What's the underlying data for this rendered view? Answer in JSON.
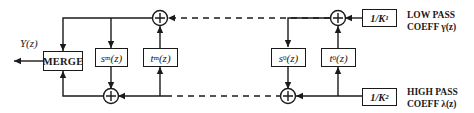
{
  "diagram": {
    "output_label": "Y(z)",
    "merge_label": "MERGE",
    "blocks": {
      "s_m": {
        "base": "s",
        "sub": "m",
        "arg": "(z)"
      },
      "t_m": {
        "base": "t",
        "sub": "m",
        "arg": "(z)"
      },
      "s_0": {
        "base": "s",
        "sub": "0",
        "arg": "(z)"
      },
      "t_0": {
        "base": "t",
        "sub": "0",
        "arg": "(z)"
      },
      "k1": {
        "base": "1/K",
        "sub": "1"
      },
      "k2": {
        "base": "1/K",
        "sub": "2"
      }
    },
    "low_pass": {
      "line1": "LOW PASS",
      "line2": "COEFF γ(z)"
    },
    "high_pass": {
      "line1": "HIGH PASS",
      "line2": "COEFF λ(z)"
    },
    "adder_symbol": "+",
    "colors": {
      "stroke": "#1a1a1a",
      "background": "#ffffff"
    }
  }
}
